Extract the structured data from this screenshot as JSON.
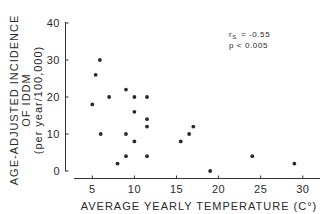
{
  "chart_data": {
    "type": "scatter",
    "title": "",
    "xlabel": "AVERAGE YEARLY TEMPERATURE (C°)",
    "ylabel_lines": [
      "AGE-ADJUSTED INCIDENCE",
      "OF IDDM",
      "(per year/100,000)"
    ],
    "xlim": [
      3,
      31
    ],
    "ylim": [
      0,
      40
    ],
    "xticks": [
      5,
      10,
      15,
      20,
      25,
      30
    ],
    "yticks": [
      0,
      10,
      20,
      30,
      40
    ],
    "grid": false,
    "legend": null,
    "annotations": [
      {
        "text_symbol": "r",
        "text_sub": "S",
        "text_rest": " = -0.55"
      },
      {
        "text": "p < 0.005"
      }
    ],
    "points": [
      {
        "x": 5.0,
        "y": 18
      },
      {
        "x": 5.4,
        "y": 26
      },
      {
        "x": 5.9,
        "y": 30
      },
      {
        "x": 6.0,
        "y": 10
      },
      {
        "x": 7.0,
        "y": 20
      },
      {
        "x": 8.0,
        "y": 2
      },
      {
        "x": 9.0,
        "y": 22
      },
      {
        "x": 9.0,
        "y": 10
      },
      {
        "x": 9.0,
        "y": 4
      },
      {
        "x": 10.0,
        "y": 20
      },
      {
        "x": 10.0,
        "y": 16
      },
      {
        "x": 10.0,
        "y": 8
      },
      {
        "x": 11.5,
        "y": 20
      },
      {
        "x": 11.5,
        "y": 14
      },
      {
        "x": 11.5,
        "y": 12
      },
      {
        "x": 11.5,
        "y": 4
      },
      {
        "x": 15.5,
        "y": 8
      },
      {
        "x": 16.5,
        "y": 10
      },
      {
        "x": 17.0,
        "y": 12
      },
      {
        "x": 19.0,
        "y": 0
      },
      {
        "x": 24.0,
        "y": 4
      },
      {
        "x": 29.0,
        "y": 2
      }
    ]
  },
  "labels": {
    "xlabel": "AVERAGE YEARLY TEMPERATURE (C°)",
    "ylabel_1": "AGE-ADJUSTED INCIDENCE",
    "ylabel_2": "OF IDDM",
    "ylabel_3": "(per year/100,000)",
    "annot_r": "r",
    "annot_r_sub": "S",
    "annot_r_value": "= -0.55",
    "annot_p": "p < 0.005"
  },
  "colors": {
    "ink": "#2a2a2a",
    "background": "#ffffff"
  }
}
